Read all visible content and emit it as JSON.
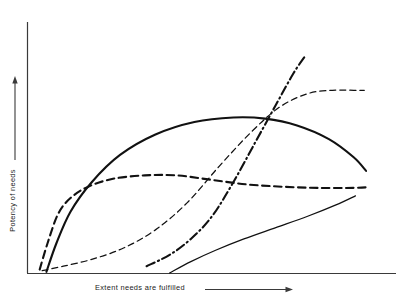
{
  "chart_data": {
    "type": "line",
    "title": "",
    "xlabel": "Extent needs are fulfilled",
    "ylabel": "Potency of needs",
    "xlim": [
      0,
      100
    ],
    "ylim": [
      0,
      100
    ],
    "grid": false,
    "legend": "none",
    "axis_arrows": {
      "x": "right-arrow",
      "y": "up-arrow"
    },
    "axes_drawn": [
      "left",
      "bottom"
    ],
    "tick_labels": {
      "x": [],
      "y": []
    },
    "series": [
      {
        "name": "thick-dashed-saturating-curve",
        "style": "dashed",
        "width": "thick",
        "color": "#111111",
        "points": [
          [
            3.3,
            1.5
          ],
          [
            5.5,
            13
          ],
          [
            8.5,
            26
          ],
          [
            12,
            33
          ],
          [
            17,
            38
          ],
          [
            24,
            41.5
          ],
          [
            33,
            43
          ],
          [
            42,
            43
          ],
          [
            52,
            41
          ],
          [
            62,
            39
          ],
          [
            72,
            38
          ],
          [
            82,
            37.5
          ],
          [
            92,
            37.5
          ],
          [
            96,
            37.8
          ]
        ]
      },
      {
        "name": "thick-solid-arch-curve",
        "style": "solid",
        "width": "thick",
        "color": "#111111",
        "points": [
          [
            5.2,
            0.5
          ],
          [
            8,
            13
          ],
          [
            12,
            27
          ],
          [
            18,
            40
          ],
          [
            26,
            52
          ],
          [
            36,
            61
          ],
          [
            47,
            66.5
          ],
          [
            58,
            68.5
          ],
          [
            67,
            68
          ],
          [
            76,
            65
          ],
          [
            85,
            59
          ],
          [
            92,
            51
          ],
          [
            95.5,
            45
          ]
        ]
      },
      {
        "name": "thin-dashed-s-curve",
        "style": "dashed",
        "width": "thin",
        "color": "#111111",
        "points": [
          [
            4,
            1
          ],
          [
            10,
            3
          ],
          [
            18,
            6
          ],
          [
            27,
            11
          ],
          [
            36,
            19
          ],
          [
            45,
            31
          ],
          [
            54,
            47
          ],
          [
            63,
            62
          ],
          [
            71,
            73
          ],
          [
            79,
            79
          ],
          [
            86,
            80.5
          ],
          [
            92,
            80.5
          ],
          [
            95,
            80.5
          ]
        ]
      },
      {
        "name": "dash-dot-steep-curve",
        "style": "dash-dot",
        "width": "thick",
        "color": "#111111",
        "points": [
          [
            33.5,
            3
          ],
          [
            40,
            8
          ],
          [
            46,
            15
          ],
          [
            52,
            25
          ],
          [
            58,
            40
          ],
          [
            64,
            57
          ],
          [
            70,
            74
          ],
          [
            75,
            88
          ],
          [
            78.5,
            96
          ]
        ]
      },
      {
        "name": "thin-solid-rising-curve",
        "style": "solid",
        "width": "thin",
        "color": "#111111",
        "points": [
          [
            40,
            0
          ],
          [
            46,
            5
          ],
          [
            53,
            10
          ],
          [
            61,
            15
          ],
          [
            70,
            20
          ],
          [
            79,
            25
          ],
          [
            87,
            30
          ],
          [
            92.5,
            34
          ]
        ]
      }
    ]
  },
  "axes": {
    "x_label_text": "Extent needs are fulfilled",
    "y_label_text": "Potency of needs"
  }
}
